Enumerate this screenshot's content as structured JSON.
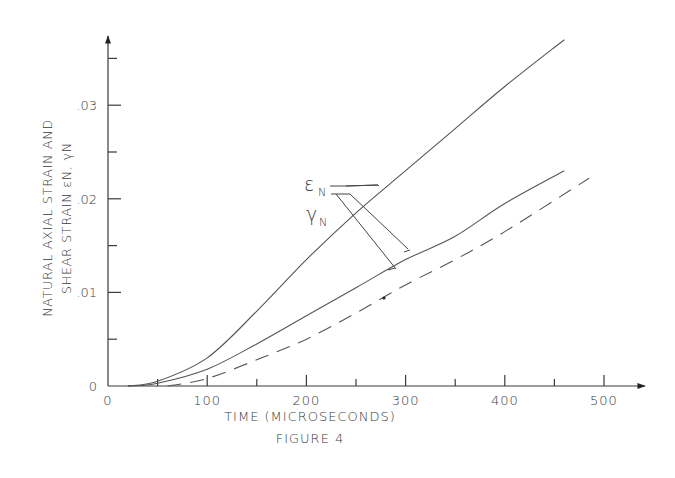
{
  "chart_data": {
    "type": "line",
    "title": "FIGURE 4",
    "xlabel": "TIME (MICROSECONDS)",
    "ylabel_line1": "NATURAL AXIAL STRAIN AND",
    "ylabel_line2": "SHEAR STRAIN εN, γN",
    "xlim": [
      0,
      530
    ],
    "ylim": [
      0,
      0.037
    ],
    "grid": false,
    "legend_position": "inline-annotations",
    "x_ticks": [
      {
        "value": 0,
        "label": "0"
      },
      {
        "value": 100,
        "label": "100"
      },
      {
        "value": 200,
        "label": "200"
      },
      {
        "value": 300,
        "label": "300"
      },
      {
        "value": 400,
        "label": "400"
      },
      {
        "value": 500,
        "label": "500"
      }
    ],
    "x_minor_ticks": [
      50,
      150,
      250,
      350,
      450
    ],
    "y_ticks": [
      {
        "value": 0,
        "label": "0"
      },
      {
        "value": 0.01,
        "label": ".01"
      },
      {
        "value": 0.02,
        "label": ".02"
      },
      {
        "value": 0.03,
        "label": ".03"
      }
    ],
    "y_minor_ticks": [
      0.005,
      0.015,
      0.025,
      0.035
    ],
    "series": [
      {
        "name": "εN (natural axial strain)",
        "style": "solid",
        "x": [
          20,
          50,
          100,
          150,
          200,
          250,
          300,
          350,
          400,
          460
        ],
        "values": [
          0,
          0.0005,
          0.003,
          0.008,
          0.0135,
          0.0185,
          0.023,
          0.0275,
          0.032,
          0.037
        ]
      },
      {
        "name": "γN (natural shear strain)",
        "style": "solid",
        "x": [
          20,
          50,
          100,
          150,
          200,
          250,
          300,
          350,
          400,
          460
        ],
        "values": [
          0,
          0.0003,
          0.0018,
          0.0045,
          0.0075,
          0.0105,
          0.0135,
          0.016,
          0.0195,
          0.023
        ]
      },
      {
        "name": "γN (dashed)",
        "style": "dashed",
        "x": [
          60,
          100,
          150,
          200,
          250,
          300,
          350,
          400,
          485
        ],
        "values": [
          0,
          0.0008,
          0.0028,
          0.005,
          0.0078,
          0.0108,
          0.0135,
          0.0165,
          0.0222
        ]
      }
    ],
    "annotations": [
      {
        "label_main": "ε",
        "label_sub": "N",
        "points_to": "upper solid curve"
      },
      {
        "label_main": "γ",
        "label_sub": "N",
        "points_to": "middle solid and dashed curves"
      }
    ]
  }
}
